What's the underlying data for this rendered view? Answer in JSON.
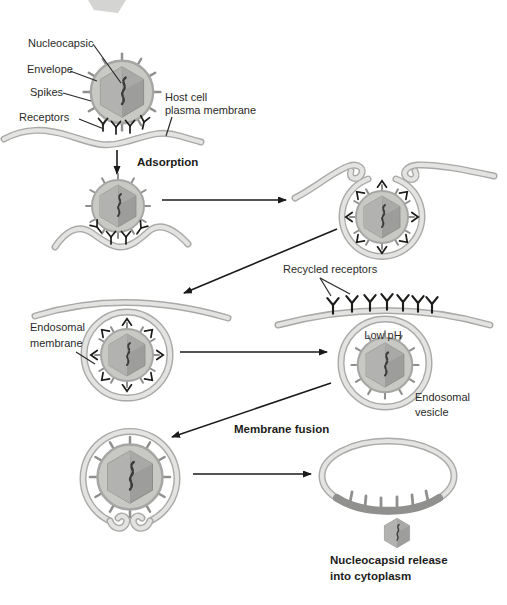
{
  "diagram": {
    "labels": {
      "nucleocapsid": "Nucleocapsic",
      "envelope": "Envelope",
      "spikes": "Spikes",
      "receptors": "Receptors",
      "host_cell_1": "Host cell",
      "host_cell_2": "plasma membrane",
      "adsorption": "Adsorption",
      "recycled_receptors": "Recycled receptors",
      "endosomal_membrane_1": "Endosomal",
      "endosomal_membrane_2": "membrane",
      "low_ph": "Low pH",
      "endosomal_vesicle_1": "Endosomal",
      "endosomal_vesicle_2": "vesicle",
      "membrane_fusion": "Membrane fusion",
      "nucleocapsid_release_1": "Nucleocapsid release",
      "nucleocapsid_release_2": "into cytoplasm"
    },
    "colors": {
      "background": "#ffffff",
      "membrane_edge": "#a9a9a7",
      "membrane_fill": "#e3e3e1",
      "virus_envelope": "#c8c8c4",
      "capsid": "#9d9d9b",
      "capsid_highlight": "#b2b2b0",
      "genome": "#3a3a38",
      "receptor": "#1c1c1a",
      "arrow": "#1a1a1a",
      "text": "#2b2b29",
      "fused_envelope_band": "#90908e"
    }
  }
}
